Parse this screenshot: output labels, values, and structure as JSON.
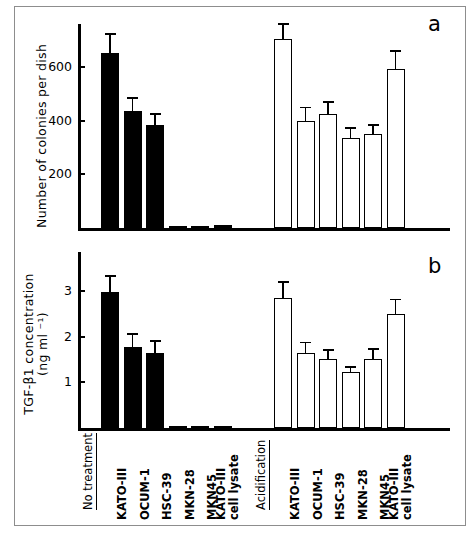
{
  "figure": {
    "panel_a_letter": "a",
    "panel_b_letter": "b",
    "group_labels": [
      "No treatment",
      "Acidification"
    ],
    "sample_labels": [
      "KATO-III",
      "OCUM-1",
      "HSC-39",
      "MKN-28",
      "MKN45",
      "KATO-III cell lysate"
    ]
  },
  "chart_data": [
    {
      "id": "panel-a",
      "type": "bar",
      "title": "",
      "panel": "a",
      "xlabel": "",
      "ylabel": "Number of colonies per dish",
      "ylim": [
        0,
        760
      ],
      "yticks": [
        200,
        400,
        600
      ],
      "ytick_labels": [
        "200",
        "400",
        "600"
      ],
      "grid": false,
      "legend": "none",
      "categories": [
        "No treatment KATO-III",
        "No treatment OCUM-1",
        "No treatment HSC-39",
        "No treatment MKN-28",
        "No treatment MKN45",
        "No treatment KATO-III cell lysate",
        "Acidification KATO-III",
        "Acidification OCUM-1",
        "Acidification HSC-39",
        "Acidification MKN-28",
        "Acidification MKN45",
        "Acidification KATO-III cell lysate"
      ],
      "series": [
        {
          "name": "No treatment",
          "fill": "solid",
          "values": [
            653,
            436,
            384,
            8,
            8,
            10
          ],
          "errors": [
            73,
            52,
            44,
            0,
            0,
            0
          ]
        },
        {
          "name": "Acidification",
          "fill": "open",
          "values": [
            703,
            400,
            423,
            337,
            352,
            594
          ],
          "errors": [
            60,
            52,
            50,
            38,
            36,
            70
          ]
        }
      ]
    },
    {
      "id": "panel-b",
      "type": "bar",
      "title": "",
      "panel": "b",
      "xlabel": "",
      "ylabel": "TGF-β1 concentration (ng ml ⁻¹)",
      "ylabel_line1": "TGF-β1 concentration",
      "ylabel_line2": "(ng ml ⁻¹)",
      "ylim": [
        0,
        3.85
      ],
      "yticks": [
        1,
        2,
        3
      ],
      "ytick_labels": [
        "1",
        "2",
        "3"
      ],
      "grid": false,
      "legend": "none",
      "categories": [
        "No treatment KATO-III",
        "No treatment OCUM-1",
        "No treatment HSC-39",
        "No treatment MKN-28",
        "No treatment MKN45",
        "No treatment KATO-III cell lysate",
        "Acidification KATO-III",
        "Acidification OCUM-1",
        "Acidification HSC-39",
        "Acidification MKN-28",
        "Acidification MKN45",
        "Acidification KATO-III cell lysate"
      ],
      "series": [
        {
          "name": "No treatment",
          "fill": "solid",
          "values": [
            2.98,
            1.78,
            1.65,
            0.05,
            0.04,
            0.05
          ],
          "errors": [
            0.37,
            0.3,
            0.28,
            0.0,
            0.0,
            0.0
          ]
        },
        {
          "name": "Acidification",
          "fill": "open",
          "values": [
            2.84,
            1.64,
            1.5,
            1.22,
            1.5,
            2.5
          ],
          "errors": [
            0.38,
            0.25,
            0.22,
            0.13,
            0.25,
            0.33
          ]
        }
      ]
    }
  ],
  "colors": {
    "ink": "#000000",
    "paper": "#ffffff",
    "frame": "#8d8d8d"
  }
}
